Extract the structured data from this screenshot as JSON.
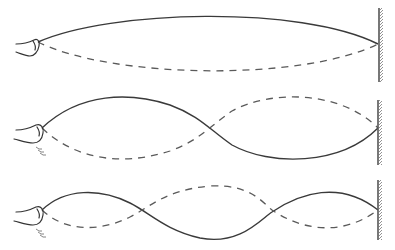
{
  "diagram": {
    "title": "Standing waves on a string fixed at one end, driven by hand",
    "colors": {
      "stroke": "#3a3a3a",
      "dashed": "#5a5a5a",
      "background": "#ffffff"
    },
    "panels": [
      {
        "id": "first-harmonic",
        "label": "1 loop",
        "loops": 1,
        "hand_moving": false,
        "wall_x": 379,
        "wall_top": 8,
        "wall_bottom": 82,
        "node_y": 43
      },
      {
        "id": "second-harmonic",
        "label": "2 loops",
        "loops": 2,
        "hand_moving": true,
        "wall_x": 378,
        "wall_top": 100,
        "wall_bottom": 165,
        "node_y": 128
      },
      {
        "id": "third-harmonic",
        "label": "3 loops",
        "loops": 3,
        "hand_moving": true,
        "wall_x": 378,
        "wall_top": 180,
        "wall_bottom": 240,
        "node_y": 210
      }
    ],
    "icons": [
      "hand-icon",
      "wall-icon",
      "motion-lines-icon"
    ]
  }
}
